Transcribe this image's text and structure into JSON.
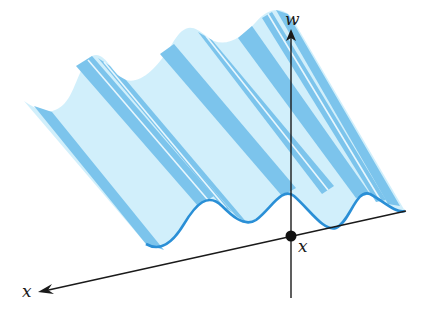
{
  "diagram": {
    "type": "3d-wave-surface",
    "axes": {
      "vertical_label": "w",
      "horizontal_label": "x",
      "origin_label": "x"
    },
    "colors": {
      "surface_fill": "#cfeefb",
      "surface_stripe": "#7cc4ec",
      "wave_curve": "#2a8fd6",
      "axis_line": "#1a1a1a",
      "origin_dot": "#111111"
    },
    "wave": {
      "visible_crests_back": 3,
      "visible_crests_front": 3
    }
  }
}
